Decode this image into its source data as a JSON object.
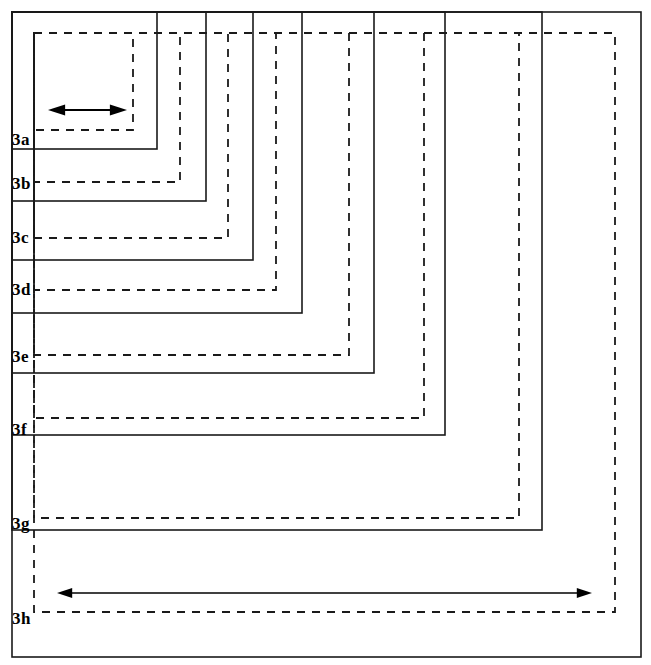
{
  "figure": {
    "type": "nested-rectangles-diagram",
    "canvas": {
      "width": 651,
      "height": 665,
      "background": "#ffffff"
    },
    "stroke_color": "#1a1a1a",
    "origin": {
      "x": 12,
      "y": 12
    },
    "dashed_origin": {
      "x": 34,
      "y": 33
    },
    "levels": [
      {
        "id": "3a",
        "label": "3a",
        "solid_right": 157,
        "solid_bottom": 149,
        "dashed_right": 133,
        "dashed_bottom": 130,
        "label_x": 12,
        "label_y": 131
      },
      {
        "id": "3b",
        "label": "3b",
        "solid_right": 206,
        "solid_bottom": 201,
        "dashed_right": 180,
        "dashed_bottom": 182,
        "label_x": 12,
        "label_y": 175
      },
      {
        "id": "3c",
        "label": "3c",
        "solid_right": 253,
        "solid_bottom": 260,
        "dashed_right": 228,
        "dashed_bottom": 238,
        "label_x": 12,
        "label_y": 229
      },
      {
        "id": "3d",
        "label": "3d",
        "solid_right": 302,
        "solid_bottom": 313,
        "dashed_right": 276,
        "dashed_bottom": 290,
        "label_x": 12,
        "label_y": 281
      },
      {
        "id": "3e",
        "label": "3e",
        "solid_right": 374,
        "solid_bottom": 373,
        "dashed_right": 349,
        "dashed_bottom": 355,
        "label_x": 12,
        "label_y": 348
      },
      {
        "id": "3f",
        "label": "3f",
        "solid_right": 445,
        "solid_bottom": 435,
        "dashed_right": 424,
        "dashed_bottom": 418,
        "label_x": 12,
        "label_y": 421
      },
      {
        "id": "3g",
        "label": "3g",
        "solid_right": 542,
        "solid_bottom": 530,
        "dashed_right": 519,
        "dashed_bottom": 518,
        "label_x": 12,
        "label_y": 515
      },
      {
        "id": "3h",
        "label": "3h",
        "solid_right": 641,
        "solid_bottom": 657,
        "dashed_right": 615,
        "dashed_bottom": 612,
        "label_x": 12,
        "label_y": 610
      }
    ],
    "arrows": [
      {
        "id": "short-arrow",
        "name": "width-arrow-3a",
        "x1": 48,
        "x2": 127,
        "y": 110,
        "double_headed": true,
        "stroke_width": 2.2,
        "head_size": 9
      },
      {
        "id": "long-arrow",
        "name": "width-arrow-3h",
        "x1": 57,
        "x2": 592,
        "y": 593,
        "double_headed": true,
        "stroke_width": 1.6,
        "head_size": 8
      }
    ]
  }
}
